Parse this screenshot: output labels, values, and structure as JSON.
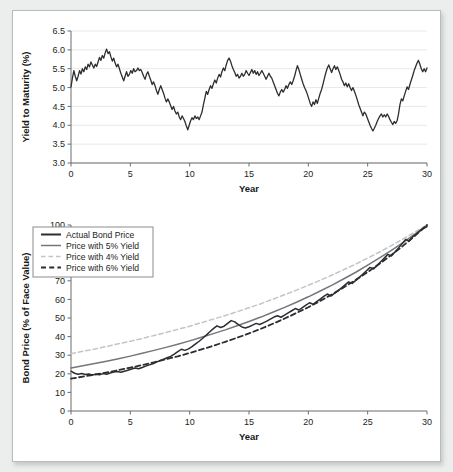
{
  "chart_data": [
    {
      "type": "line",
      "id": "yield-to-maturity",
      "title": "",
      "xlabel": "Year",
      "ylabel": "Yield to Maturity (%)",
      "xlim": [
        0,
        30
      ],
      "ylim": [
        3.0,
        6.5
      ],
      "xticks": [
        0,
        5,
        10,
        15,
        20,
        25,
        30
      ],
      "yticks": [
        3.0,
        3.5,
        4.0,
        4.5,
        5.0,
        5.5,
        6.0,
        6.5
      ],
      "xtick_labels": [
        "0",
        "5",
        "10",
        "15",
        "20",
        "25",
        "30"
      ],
      "ytick_labels": [
        "3.0",
        "3.5",
        "4.0",
        "4.5",
        "5.0",
        "5.5",
        "6.0",
        "6.5"
      ],
      "grid": true,
      "legend": null,
      "series": [
        {
          "name": "Yield to Maturity",
          "color": "#2b2d30",
          "style": "solid",
          "width": 1.3,
          "x": [
            0,
            0.12,
            0.24,
            0.36,
            0.48,
            0.6,
            0.72,
            0.84,
            0.96,
            1.08,
            1.2,
            1.32,
            1.44,
            1.56,
            1.68,
            1.8,
            1.92,
            2.04,
            2.16,
            2.28,
            2.4,
            2.52,
            2.64,
            2.76,
            2.88,
            3,
            3.12,
            3.24,
            3.36,
            3.48,
            3.6,
            3.72,
            3.84,
            3.96,
            4.08,
            4.2,
            4.32,
            4.44,
            4.56,
            4.68,
            4.8,
            4.92,
            5.04,
            5.16,
            5.28,
            5.4,
            5.52,
            5.64,
            5.76,
            5.88,
            6,
            6.12,
            6.24,
            6.36,
            6.48,
            6.6,
            6.72,
            6.84,
            6.96,
            7.08,
            7.2,
            7.32,
            7.44,
            7.56,
            7.68,
            7.8,
            7.92,
            8.04,
            8.16,
            8.28,
            8.4,
            8.52,
            8.64,
            8.76,
            8.88,
            9,
            9.12,
            9.24,
            9.36,
            9.48,
            9.6,
            9.72,
            9.84,
            9.96,
            10.08,
            10.2,
            10.32,
            10.44,
            10.56,
            10.68,
            10.8,
            10.92,
            11.04,
            11.16,
            11.28,
            11.4,
            11.52,
            11.64,
            11.76,
            11.88,
            12,
            12.12,
            12.24,
            12.36,
            12.48,
            12.6,
            12.72,
            12.84,
            12.96,
            13.08,
            13.2,
            13.32,
            13.44,
            13.56,
            13.68,
            13.8,
            13.92,
            14.04,
            14.16,
            14.28,
            14.4,
            14.52,
            14.64,
            14.76,
            14.88,
            15,
            15.12,
            15.24,
            15.36,
            15.48,
            15.6,
            15.72,
            15.84,
            15.96,
            16.08,
            16.2,
            16.32,
            16.44,
            16.56,
            16.68,
            16.8,
            16.92,
            17.04,
            17.16,
            17.28,
            17.4,
            17.52,
            17.64,
            17.76,
            17.88,
            18,
            18.12,
            18.24,
            18.36,
            18.48,
            18.6,
            18.72,
            18.84,
            18.96,
            19.08,
            19.2,
            19.32,
            19.44,
            19.56,
            19.68,
            19.8,
            19.92,
            20.04,
            20.16,
            20.28,
            20.4,
            20.52,
            20.64,
            20.76,
            20.88,
            21,
            21.12,
            21.24,
            21.36,
            21.48,
            21.6,
            21.72,
            21.84,
            21.96,
            22.08,
            22.2,
            22.32,
            22.44,
            22.56,
            22.68,
            22.8,
            22.92,
            23.04,
            23.16,
            23.28,
            23.4,
            23.52,
            23.64,
            23.76,
            23.88,
            24,
            24.12,
            24.24,
            24.36,
            24.48,
            24.6,
            24.72,
            24.84,
            24.96,
            25.08,
            25.2,
            25.32,
            25.44,
            25.56,
            25.68,
            25.8,
            25.92,
            26.04,
            26.16,
            26.28,
            26.4,
            26.52,
            26.64,
            26.76,
            26.88,
            27,
            27.12,
            27.24,
            27.36,
            27.48,
            27.6,
            27.72,
            27.84,
            27.96,
            28.08,
            28.2,
            28.32,
            28.44,
            28.56,
            28.68,
            28.8,
            28.92,
            29.04,
            29.16,
            29.28,
            29.4,
            29.52,
            29.64,
            29.76,
            29.88,
            30
          ],
          "y": [
            5.02,
            5.25,
            5.45,
            5.3,
            5.18,
            5.3,
            5.45,
            5.36,
            5.5,
            5.42,
            5.55,
            5.48,
            5.62,
            5.55,
            5.68,
            5.6,
            5.52,
            5.62,
            5.56,
            5.68,
            5.8,
            5.72,
            5.85,
            5.78,
            5.92,
            6.02,
            5.9,
            5.95,
            5.82,
            5.7,
            5.78,
            5.65,
            5.55,
            5.62,
            5.5,
            5.38,
            5.28,
            5.18,
            5.3,
            5.42,
            5.3,
            5.35,
            5.45,
            5.38,
            5.5,
            5.42,
            5.45,
            5.52,
            5.45,
            5.48,
            5.4,
            5.3,
            5.22,
            5.35,
            5.42,
            5.3,
            5.2,
            5.08,
            5.15,
            5.05,
            4.92,
            4.82,
            4.95,
            5.05,
            4.95,
            4.85,
            4.72,
            4.62,
            4.7,
            4.62,
            4.52,
            4.42,
            4.5,
            4.38,
            4.3,
            4.35,
            4.22,
            4.15,
            4.25,
            4.18,
            4.1,
            3.98,
            3.88,
            4.0,
            4.12,
            4.2,
            4.15,
            4.25,
            4.18,
            4.22,
            4.15,
            4.25,
            4.35,
            4.55,
            4.72,
            4.9,
            4.82,
            4.95,
            5.05,
            4.98,
            5.1,
            5.2,
            5.12,
            5.25,
            5.35,
            5.28,
            5.42,
            5.52,
            5.45,
            5.6,
            5.72,
            5.78,
            5.7,
            5.58,
            5.48,
            5.4,
            5.3,
            5.35,
            5.25,
            5.3,
            5.38,
            5.3,
            5.35,
            5.45,
            5.38,
            5.32,
            5.4,
            5.48,
            5.38,
            5.45,
            5.35,
            5.42,
            5.32,
            5.38,
            5.45,
            5.38,
            5.3,
            5.22,
            5.3,
            5.38,
            5.3,
            5.25,
            5.15,
            5.05,
            4.95,
            4.85,
            4.78,
            4.88,
            4.95,
            4.88,
            4.95,
            5.05,
            4.98,
            5.08,
            5.15,
            5.08,
            5.18,
            5.3,
            5.45,
            5.58,
            5.48,
            5.35,
            5.22,
            5.1,
            5.0,
            4.92,
            4.82,
            4.7,
            4.58,
            4.5,
            4.62,
            4.55,
            4.68,
            4.58,
            4.72,
            4.85,
            4.95,
            5.1,
            5.25,
            5.4,
            5.52,
            5.6,
            5.5,
            5.4,
            5.5,
            5.58,
            5.48,
            5.55,
            5.45,
            5.35,
            5.22,
            5.15,
            5.05,
            5.12,
            5.02,
            5.1,
            5.0,
            4.92,
            5.0,
            4.9,
            4.8,
            4.68,
            4.55,
            4.45,
            4.35,
            4.25,
            4.35,
            4.3,
            4.2,
            4.1,
            4.0,
            3.92,
            3.85,
            3.92,
            4.0,
            4.1,
            4.18,
            4.25,
            4.3,
            4.22,
            4.28,
            4.22,
            4.3,
            4.24,
            4.15,
            4.08,
            4.02,
            4.1,
            4.05,
            4.12,
            4.3,
            4.55,
            4.7,
            4.65,
            4.78,
            4.9,
            5.02,
            4.95,
            5.08,
            5.2,
            5.32,
            5.45,
            5.55,
            5.65,
            5.72,
            5.62,
            5.5,
            5.42,
            5.5,
            5.42,
            5.52,
            5.45,
            5.35,
            5.25,
            5.32,
            5.22,
            5.3,
            5.4,
            5.5,
            5.58
          ]
        }
      ]
    },
    {
      "type": "line",
      "id": "bond-price",
      "title": "",
      "xlabel": "Year",
      "ylabel": "Bond Price (% of Face Value)",
      "xlim": [
        0,
        30
      ],
      "ylim": [
        0,
        100
      ],
      "xticks": [
        0,
        5,
        10,
        15,
        20,
        25,
        30
      ],
      "yticks": [
        0,
        10,
        20,
        30,
        40,
        50,
        60,
        70,
        80,
        90,
        100
      ],
      "xtick_labels": [
        "0",
        "5",
        "10",
        "15",
        "20",
        "25",
        "30"
      ],
      "ytick_labels": [
        "0",
        "10",
        "20",
        "30",
        "40",
        "50",
        "60",
        "70",
        "80",
        "90",
        "100"
      ],
      "grid": false,
      "legend": {
        "position": "upper-left",
        "entries": [
          {
            "label": "Actual Bond Price",
            "color": "#2b2d30",
            "style": "solid",
            "width": 2.0
          },
          {
            "label": "Price with 5% Yield",
            "color": "#73767a",
            "style": "solid",
            "width": 1.5
          },
          {
            "label": "Price with 4% Yield",
            "color": "#c2c5c8",
            "style": "dashed",
            "width": 1.5
          },
          {
            "label": "Price with 6% Yield",
            "color": "#2b2d30",
            "style": "dashed",
            "width": 1.8
          }
        ]
      },
      "series": [
        {
          "name": "Price with 4% Yield",
          "color": "#c2c5c8",
          "style": "dashed",
          "width": 1.5,
          "x": [
            0,
            1,
            2,
            3,
            4,
            5,
            6,
            7,
            8,
            9,
            10,
            11,
            12,
            13,
            14,
            15,
            16,
            17,
            18,
            19,
            20,
            21,
            22,
            23,
            24,
            25,
            26,
            27,
            28,
            29,
            30
          ],
          "y": [
            30.8,
            32.1,
            33.3,
            34.7,
            36.1,
            37.5,
            39.0,
            40.6,
            42.2,
            43.9,
            45.6,
            47.5,
            49.4,
            51.3,
            53.4,
            55.5,
            57.7,
            60.1,
            62.5,
            65.0,
            67.6,
            70.3,
            73.1,
            76.0,
            79.0,
            82.2,
            85.5,
            88.9,
            92.5,
            96.2,
            100.0
          ]
        },
        {
          "name": "Price with 5% Yield",
          "color": "#73767a",
          "style": "solid",
          "width": 1.5,
          "x": [
            0,
            1,
            2,
            3,
            4,
            5,
            6,
            7,
            8,
            9,
            10,
            11,
            12,
            13,
            14,
            15,
            16,
            17,
            18,
            19,
            20,
            21,
            22,
            23,
            24,
            25,
            26,
            27,
            28,
            29,
            30
          ],
          "y": [
            23.1,
            24.3,
            25.5,
            26.8,
            28.1,
            29.5,
            31.0,
            32.6,
            34.2,
            35.9,
            37.7,
            39.6,
            41.6,
            43.6,
            45.8,
            48.1,
            50.5,
            53.1,
            55.7,
            58.5,
            61.4,
            64.5,
            67.7,
            71.1,
            74.6,
            78.4,
            82.3,
            86.4,
            90.7,
            95.2,
            100.0
          ]
        },
        {
          "name": "Price with 6% Yield",
          "color": "#2b2d30",
          "style": "dashed",
          "width": 1.8,
          "x": [
            0,
            1,
            2,
            3,
            4,
            5,
            6,
            7,
            8,
            9,
            10,
            11,
            12,
            13,
            14,
            15,
            16,
            17,
            18,
            19,
            20,
            21,
            22,
            23,
            24,
            25,
            26,
            27,
            28,
            29,
            30
          ],
          "y": [
            17.4,
            18.5,
            19.6,
            20.7,
            22.0,
            23.3,
            24.7,
            26.2,
            27.8,
            29.4,
            31.2,
            33.1,
            35.1,
            37.2,
            39.4,
            41.7,
            44.2,
            46.9,
            49.7,
            52.7,
            55.8,
            59.2,
            62.7,
            66.5,
            70.5,
            74.7,
            79.2,
            83.9,
            88.9,
            94.3,
            100.0
          ]
        },
        {
          "name": "Actual Bond Price",
          "color": "#2b2d30",
          "style": "solid",
          "width": 1.5,
          "x": [
            0,
            0.3,
            0.6,
            0.9,
            1.2,
            1.5,
            1.8,
            2.1,
            2.4,
            2.7,
            3,
            3.3,
            3.6,
            3.9,
            4.2,
            4.5,
            4.8,
            5.1,
            5.4,
            5.7,
            6,
            6.3,
            6.6,
            6.9,
            7.2,
            7.5,
            7.8,
            8.1,
            8.4,
            8.7,
            9,
            9.3,
            9.6,
            9.9,
            10.2,
            10.5,
            10.8,
            11.1,
            11.4,
            11.7,
            12,
            12.3,
            12.6,
            12.9,
            13.2,
            13.5,
            13.8,
            14.1,
            14.4,
            14.7,
            15,
            15.3,
            15.6,
            15.9,
            16.2,
            16.5,
            16.8,
            17.1,
            17.4,
            17.7,
            18,
            18.3,
            18.6,
            18.9,
            19.2,
            19.5,
            19.8,
            20.1,
            20.4,
            20.7,
            21,
            21.3,
            21.6,
            21.9,
            22.2,
            22.5,
            22.8,
            23.1,
            23.4,
            23.7,
            24,
            24.3,
            24.6,
            24.9,
            25.2,
            25.5,
            25.8,
            26.1,
            26.4,
            26.7,
            27,
            27.3,
            27.6,
            27.9,
            28.2,
            28.5,
            28.8,
            29.1,
            29.4,
            29.7,
            30
          ],
          "y": [
            21.4,
            20.3,
            19.8,
            20.2,
            19.6,
            19.9,
            19.4,
            19.8,
            19.5,
            20.1,
            19.8,
            20.4,
            20.9,
            21.2,
            20.8,
            21.4,
            21.9,
            22.6,
            23.1,
            22.7,
            23.4,
            24.1,
            24.8,
            25.4,
            26.3,
            27.1,
            27.8,
            28.6,
            29.4,
            30.6,
            31.9,
            33.2,
            32.6,
            33.4,
            34.6,
            36.1,
            37.5,
            39.1,
            40.8,
            42.6,
            44.3,
            45.8,
            44.9,
            45.6,
            47.1,
            48.6,
            47.9,
            46.4,
            45.2,
            44.6,
            45.3,
            46.2,
            47.1,
            46.5,
            47.4,
            48.3,
            49.4,
            50.5,
            51.2,
            50.4,
            51.5,
            52.7,
            53.9,
            55.1,
            54.3,
            55.6,
            56.9,
            58.2,
            57.4,
            58.8,
            60.2,
            61.6,
            62.9,
            61.8,
            63.2,
            64.7,
            66.2,
            67.8,
            69.4,
            68.6,
            70.2,
            71.9,
            73.6,
            75.4,
            77.2,
            76.4,
            78.3,
            80.2,
            82.2,
            84.2,
            83.4,
            85.5,
            87.7,
            89.9,
            92.2,
            91.4,
            93.7,
            95.1,
            96.8,
            98.1,
            99.2,
            100.0
          ]
        }
      ]
    }
  ]
}
